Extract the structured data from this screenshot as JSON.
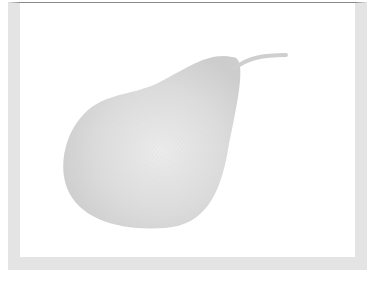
{
  "image": {
    "subject": "pear illustration",
    "colors": {
      "frame": "#e4e4e4",
      "frame_top_line": "#8a8a8a",
      "background": "#ffffff",
      "pear_fill": "#d9d9d9",
      "pear_highlight": "#ececec",
      "pear_shadow": "#c8c8c8"
    }
  }
}
